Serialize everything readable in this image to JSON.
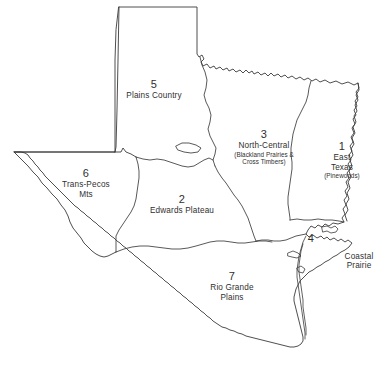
{
  "figure": {
    "line_color": "#3b3b3b",
    "background_color": "#ffffff",
    "caption": ""
  },
  "regions": [
    {
      "number": "1",
      "name_line1": "East",
      "name_line2": "Texas",
      "subtitle": "(Pinewoods)"
    },
    {
      "number": "2",
      "name_line1": "Edwards Plateau",
      "name_line2": "",
      "subtitle": ""
    },
    {
      "number": "3",
      "name_line1": "North-Central",
      "name_line2": "",
      "subtitle_line1": "(Blackland Prairies &",
      "subtitle_line2": "Cross Timbers)"
    },
    {
      "number": "4",
      "name_line1": "Coastal",
      "name_line2": "Prairie",
      "subtitle": ""
    },
    {
      "number": "5",
      "name_line1": "Plains Country",
      "name_line2": "",
      "subtitle": ""
    },
    {
      "number": "6",
      "name_line1": "Trans-Pecos",
      "name_line2": "Mts",
      "subtitle": ""
    },
    {
      "number": "7",
      "name_line1": "Rio Grande",
      "name_line2": "Plains",
      "subtitle": ""
    }
  ]
}
